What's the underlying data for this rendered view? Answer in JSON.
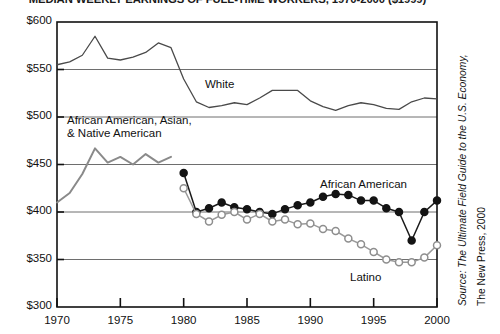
{
  "chart_data": {
    "type": "line",
    "title": "MEDIAN WEEKLY EARNINGS OF FULL-TIME WORKERS, 1970-2000 ($1999)",
    "xlabel": "",
    "ylabel": "",
    "xlim": [
      1970,
      2000
    ],
    "ylim": [
      300,
      600
    ],
    "grid": true,
    "grid_axis": "y",
    "legend": "inline-labels",
    "x_ticks": [
      1970,
      1975,
      1980,
      1985,
      1990,
      1995,
      2000
    ],
    "x_tick_labels": [
      "1970",
      "1975",
      "1980",
      "1985",
      "1990",
      "1995",
      "2000"
    ],
    "y_ticks": [
      300,
      350,
      400,
      450,
      500,
      550,
      600
    ],
    "y_tick_labels": [
      "$300",
      "$350",
      "$400",
      "$450",
      "$500",
      "$550",
      "$600"
    ],
    "series": [
      {
        "name": "White",
        "label": "White",
        "color": "#4a4a4a",
        "marker": "none",
        "x": [
          1970,
          1971,
          1972,
          1973,
          1974,
          1975,
          1976,
          1977,
          1978,
          1979,
          1980,
          1981,
          1982,
          1983,
          1984,
          1985,
          1986,
          1987,
          1988,
          1989,
          1990,
          1991,
          1992,
          1993,
          1994,
          1995,
          1996,
          1997,
          1998,
          1999,
          2000
        ],
        "values": [
          555,
          558,
          565,
          585,
          562,
          560,
          563,
          568,
          578,
          573,
          540,
          516,
          510,
          512,
          515,
          513,
          520,
          528,
          528,
          528,
          517,
          511,
          507,
          512,
          515,
          513,
          509,
          508,
          516,
          520,
          519
        ]
      },
      {
        "name": "African American, Asian, & Native American",
        "label": "African American, Asian,\n& Native American",
        "color": "#8a8a8a",
        "marker": "none",
        "x": [
          1970,
          1971,
          1972,
          1973,
          1974,
          1975,
          1976,
          1977,
          1978,
          1979
        ],
        "values": [
          410,
          420,
          440,
          467,
          452,
          458,
          450,
          461,
          452,
          458
        ]
      },
      {
        "name": "African American",
        "label": "African American",
        "color": "#1a1a1a",
        "marker": "filled-circle",
        "x": [
          1980,
          1981,
          1982,
          1983,
          1984,
          1985,
          1986,
          1987,
          1988,
          1989,
          1990,
          1991,
          1992,
          1993,
          1994,
          1995,
          1996,
          1997,
          1998,
          1999,
          2000
        ],
        "values": [
          441,
          400,
          404,
          410,
          405,
          403,
          400,
          398,
          403,
          407,
          410,
          416,
          419,
          418,
          412,
          412,
          404,
          400,
          370,
          400,
          412
        ]
      },
      {
        "name": "Latino",
        "label": "Latino",
        "color": "#9a9a9a",
        "marker": "open-circle",
        "x": [
          1980,
          1981,
          1982,
          1983,
          1984,
          1985,
          1986,
          1987,
          1988,
          1989,
          1990,
          1991,
          1992,
          1993,
          1994,
          1995,
          1996,
          1997,
          1998,
          1999,
          2000
        ],
        "values": [
          425,
          398,
          390,
          397,
          400,
          392,
          398,
          390,
          392,
          387,
          388,
          382,
          380,
          372,
          366,
          358,
          350,
          347,
          347,
          352,
          365
        ]
      }
    ],
    "series_label_positions": [
      {
        "series": "White",
        "x_px": 205,
        "y_px": 78
      },
      {
        "series": "African American, Asian, & Native American",
        "x_px": 67,
        "y_px": 114
      },
      {
        "series": "African American",
        "x_px": 320,
        "y_px": 178
      },
      {
        "series": "Latino",
        "x_px": 350,
        "y_px": 271
      }
    ],
    "annotations": [
      "Source: The Ultimate Field Guide to the U.S. Economy,",
      "The New Press, 2000"
    ]
  },
  "source": {
    "line1": "Source: The Ultimate Field Guide to the U.S. Economy,",
    "line2": "The New Press, 2000"
  }
}
